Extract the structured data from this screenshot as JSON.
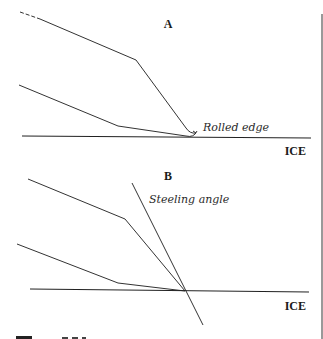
{
  "panel_a": {
    "title": "A",
    "annotation": "Rolled edge",
    "surface_label": "ICE"
  },
  "panel_b": {
    "title": "B",
    "annotation": "Steeling angle",
    "surface_label": "ICE"
  },
  "caption_partial": "Figure 6.3"
}
